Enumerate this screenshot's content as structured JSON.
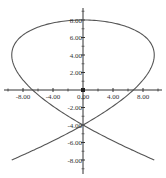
{
  "chart_data": {
    "type": "line",
    "title": "",
    "xlabel": "",
    "ylabel": "",
    "xlim": [
      -11,
      11
    ],
    "ylim": [
      -10,
      10
    ],
    "grid": false,
    "legend": "none",
    "curve": {
      "kind": "parametric",
      "x_expr": "9.5*sin(3t)",
      "y_expr": "8*cos(2t)",
      "t_range": [
        0,
        6.2832
      ]
    },
    "x_ticks": [
      {
        "value": -8,
        "label": "-8.00"
      },
      {
        "value": -4,
        "label": "-4.00"
      },
      {
        "value": 0,
        "label": "0.00"
      },
      {
        "value": 4,
        "label": "4.00"
      },
      {
        "value": 8,
        "label": "8.00"
      }
    ],
    "y_ticks": [
      {
        "value": 8,
        "label": "8.00"
      },
      {
        "value": 6,
        "label": "6.00"
      },
      {
        "value": 4,
        "label": "4.00"
      },
      {
        "value": 2,
        "label": "2.00"
      },
      {
        "value": -2,
        "label": "-2.00"
      },
      {
        "value": -4,
        "label": "-4.00"
      },
      {
        "value": -6,
        "label": "-6.00"
      },
      {
        "value": -8,
        "label": "-8.00"
      }
    ],
    "colors": {
      "curve": "#555555",
      "axis": "#333333"
    }
  }
}
